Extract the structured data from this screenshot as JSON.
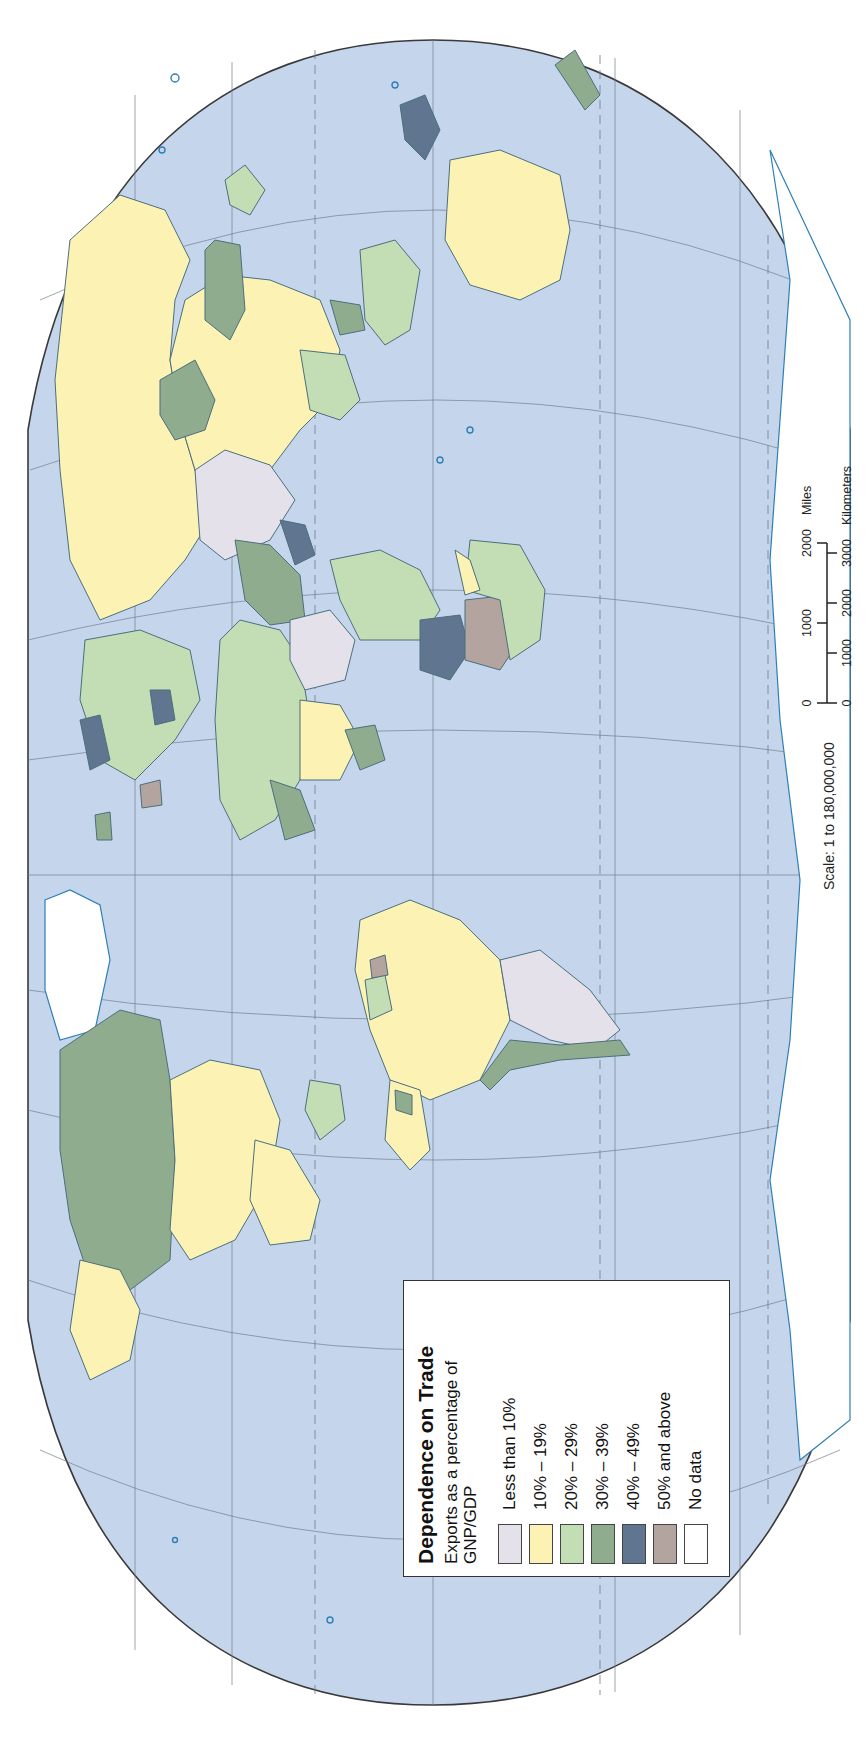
{
  "map": {
    "title": "Dependence on Trade",
    "orientation": "rotated 90° counter-clockwise (north at left)",
    "ocean_color": "#c5d6ec",
    "border_color": "#4b6f7d",
    "coast_color": "#2f7fb6"
  },
  "legend": {
    "title": "Dependence on Trade",
    "subtitle_line1": "Exports as a percentage of",
    "subtitle_line2": "GNP/GDP",
    "items": [
      {
        "label": "Less than 10%",
        "color": "#e4e1ea"
      },
      {
        "label": "10% – 19%",
        "color": "#fbf2b4"
      },
      {
        "label": "20% – 29%",
        "color": "#c3ddb4"
      },
      {
        "label": "30% – 39%",
        "color": "#8fac8e"
      },
      {
        "label": "40% – 49%",
        "color": "#5f7590"
      },
      {
        "label": "50% and above",
        "color": "#b4a49f"
      },
      {
        "label": "No data",
        "color": "#ffffff"
      }
    ]
  },
  "scale": {
    "text": "Scale:  1 to 180,000,000",
    "miles_label": "Miles",
    "km_label": "Kilometers",
    "miles_ticks": [
      "0",
      "1000",
      "2000"
    ],
    "km_ticks": [
      "0",
      "1000",
      "2000",
      "3000"
    ]
  },
  "regions": [
    {
      "name": "Russia",
      "category": "10% – 19%"
    },
    {
      "name": "Canada",
      "category": "30% – 39%"
    },
    {
      "name": "United States",
      "category": "10% – 19%"
    },
    {
      "name": "Mexico",
      "category": "10% – 19%"
    },
    {
      "name": "Brazil",
      "category": "10% – 19%"
    },
    {
      "name": "Argentina",
      "category": "Less than 10%"
    },
    {
      "name": "Chile",
      "category": "30% – 39%"
    },
    {
      "name": "Greenland",
      "category": "No data"
    },
    {
      "name": "Antarctica",
      "category": "No data"
    },
    {
      "name": "Australia",
      "category": "10% – 19%"
    },
    {
      "name": "China",
      "category": "10% – 19%"
    },
    {
      "name": "India",
      "category": "Less than 10%"
    },
    {
      "name": "Kazakhstan",
      "category": "30% – 39%"
    },
    {
      "name": "Saudi Arabia",
      "category": "30% – 39%"
    },
    {
      "name": "Democratic Republic of the Congo",
      "category": "Less than 10%"
    },
    {
      "name": "Angola",
      "category": "40% – 49%"
    },
    {
      "name": "Namibia",
      "category": "50% and above"
    },
    {
      "name": "Botswana",
      "category": "50% and above"
    },
    {
      "name": "Papua New Guinea",
      "category": "40% – 49%"
    },
    {
      "name": "Iceland",
      "category": "30% – 39%"
    }
  ]
}
